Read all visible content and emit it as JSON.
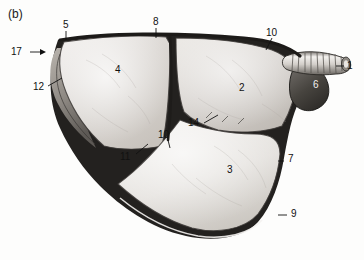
{
  "figure": {
    "panel_label": "(b)",
    "type": "anatomical-photograph",
    "background_color": "#ffffff",
    "ink_color": "#111111"
  },
  "labels": [
    {
      "id": "panel",
      "text": "(b)",
      "x": 12,
      "y": 14,
      "leader": "none"
    },
    {
      "id": "l17",
      "text": "17",
      "x": 11,
      "y": 52,
      "leader": "arrow-right"
    },
    {
      "id": "l5",
      "text": "5",
      "x": 63,
      "y": 27,
      "leader": "tick-down"
    },
    {
      "id": "l8",
      "text": "8",
      "x": 153,
      "y": 22,
      "leader": "tick-down"
    },
    {
      "id": "l10a",
      "text": "10",
      "x": 266,
      "y": 32,
      "leader": "tick-down-left"
    },
    {
      "id": "l1",
      "text": "1",
      "x": 345,
      "y": 67,
      "leader": "tick-left"
    },
    {
      "id": "l6",
      "text": "6",
      "x": 314,
      "y": 84,
      "leader": "none"
    },
    {
      "id": "l4",
      "text": "4",
      "x": 115,
      "y": 70,
      "leader": "none"
    },
    {
      "id": "l2",
      "text": "2",
      "x": 239,
      "y": 88,
      "leader": "none"
    },
    {
      "id": "l12",
      "text": "12",
      "x": 34,
      "y": 89,
      "leader": "diag-up-right"
    },
    {
      "id": "l14",
      "text": "14",
      "x": 190,
      "y": 122,
      "leader": "diag-up-right"
    },
    {
      "id": "l10b",
      "text": "10",
      "x": 160,
      "y": 142,
      "leader": "tick-down"
    },
    {
      "id": "l11",
      "text": "11",
      "x": 122,
      "y": 157,
      "leader": "diag-up-right"
    },
    {
      "id": "l3",
      "text": "3",
      "x": 228,
      "y": 170,
      "leader": "none"
    },
    {
      "id": "l7",
      "text": "7",
      "x": 285,
      "y": 158,
      "leader": "tick-left"
    },
    {
      "id": "l9",
      "text": "9",
      "x": 288,
      "y": 214,
      "leader": "tick-left"
    }
  ],
  "structures": {
    "lobe_cranial": {
      "number": "4",
      "shade": "#dedad6"
    },
    "lobe_middle": {
      "number": "2",
      "shade": "#d9d5d1"
    },
    "lobe_caudal": {
      "number": "3",
      "shade": "#e6e3df"
    },
    "accessory_lobe": {
      "number": "6",
      "shade": "#4a4744"
    },
    "trachea": {
      "number": "1",
      "shade": "#cfcbc6",
      "rings": 11
    }
  }
}
